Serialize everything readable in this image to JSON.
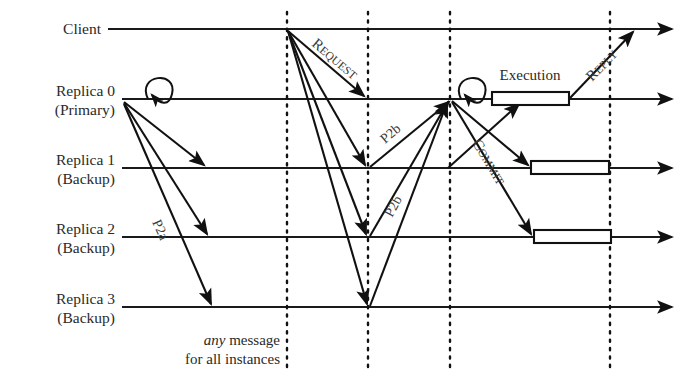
{
  "diagram": {
    "type": "sequence-diagram",
    "canvas": {
      "width": 696,
      "height": 383,
      "background": "#ffffff"
    },
    "ink_color": "#111111",
    "text_color": "#2a2a2a",
    "lifelines": [
      {
        "id": "client",
        "label": "Client",
        "sublabel": "",
        "y": 29,
        "x_start": 108,
        "x_end": 680
      },
      {
        "id": "replica0",
        "label": "Replica 0",
        "sublabel": "(Primary)",
        "y": 99,
        "x_start": 122,
        "x_end": 680
      },
      {
        "id": "replica1",
        "label": "Replica 1",
        "sublabel": "(Backup)",
        "y": 168,
        "x_start": 122,
        "x_end": 680
      },
      {
        "id": "replica2",
        "label": "Replica 2",
        "sublabel": "(Backup)",
        "y": 237,
        "x_start": 122,
        "x_end": 680
      },
      {
        "id": "replica3",
        "label": "Replica 3",
        "sublabel": "(Backup)",
        "y": 307,
        "x_start": 122,
        "x_end": 680
      }
    ],
    "phase_markers": [
      {
        "id": "marker-1",
        "x": 287,
        "y_top": 12,
        "y_bottom": 372
      },
      {
        "id": "marker-2",
        "x": 368,
        "y_top": 12,
        "y_bottom": 372
      },
      {
        "id": "marker-3",
        "x": 450,
        "y_top": 12,
        "y_bottom": 372
      },
      {
        "id": "marker-4",
        "x": 610,
        "y_top": 12,
        "y_bottom": 372
      }
    ],
    "messages": [
      {
        "id": "p2a-1",
        "label": "P2a",
        "from": "replica0",
        "to": "replica1",
        "x1": 124,
        "y1": 102,
        "x2": 206,
        "y2": 166
      },
      {
        "id": "p2a-2",
        "label": "",
        "from": "replica0",
        "to": "replica2",
        "x1": 124,
        "y1": 103,
        "x2": 209,
        "y2": 235
      },
      {
        "id": "p2a-3",
        "label": "",
        "from": "replica0",
        "to": "replica3",
        "x1": 124,
        "y1": 104,
        "x2": 213,
        "y2": 305
      },
      {
        "id": "req-0",
        "label": "REQUEST",
        "from": "client",
        "to": "replica0",
        "x1": 288,
        "y1": 31,
        "x2": 366,
        "y2": 97
      },
      {
        "id": "req-1",
        "label": "",
        "from": "client",
        "to": "replica1",
        "x1": 288,
        "y1": 31,
        "x2": 366,
        "y2": 166
      },
      {
        "id": "req-2",
        "label": "",
        "from": "client",
        "to": "replica2",
        "x1": 288,
        "y1": 31,
        "x2": 366,
        "y2": 235
      },
      {
        "id": "req-3",
        "label": "",
        "from": "client",
        "to": "replica3",
        "x1": 288,
        "y1": 31,
        "x2": 366,
        "y2": 305
      },
      {
        "id": "p2b-1",
        "label": "P2b",
        "from": "replica1",
        "to": "replica0",
        "x1": 370,
        "y1": 166,
        "x2": 450,
        "y2": 101
      },
      {
        "id": "p2b-2",
        "label": "P2b",
        "from": "replica2",
        "to": "replica0",
        "x1": 370,
        "y1": 235,
        "x2": 450,
        "y2": 101
      },
      {
        "id": "p2b-3",
        "label": "",
        "from": "replica3",
        "to": "replica0",
        "x1": 370,
        "y1": 305,
        "x2": 450,
        "y2": 102
      },
      {
        "id": "commit-1",
        "label": "",
        "from": "replica0",
        "to": "replica1",
        "x1": 452,
        "y1": 101,
        "x2": 530,
        "y2": 166
      },
      {
        "id": "commit-2",
        "label": "COMMIT",
        "from": "replica0",
        "to": "replica2",
        "x1": 452,
        "y1": 102,
        "x2": 533,
        "y2": 235
      },
      {
        "id": "exec-ack",
        "label": "",
        "from": "replica1",
        "to": "replica0",
        "x1": 448,
        "y1": 167,
        "x2": 521,
        "y2": 103
      },
      {
        "id": "reply",
        "label": "REPLY",
        "from": "replica0",
        "to": "client",
        "x1": 570,
        "y1": 97,
        "x2": 634,
        "y2": 31
      }
    ],
    "self_loops": [
      {
        "id": "loop-propose",
        "on": "replica0",
        "cx": 156,
        "cy": 92,
        "rx": 17,
        "ry": 22
      },
      {
        "id": "loop-decide",
        "on": "replica0",
        "cx": 469,
        "cy": 92,
        "rx": 17,
        "ry": 22
      }
    ],
    "execution_boxes": [
      {
        "id": "exec-replica0",
        "on": "replica0",
        "label": "Execution",
        "x": 492,
        "y": 91,
        "width": 77,
        "height": 14
      },
      {
        "id": "exec-replica1",
        "on": "replica1",
        "label": "",
        "x": 531,
        "y": 160,
        "width": 78,
        "height": 14
      },
      {
        "id": "exec-replica2",
        "on": "replica2",
        "label": "",
        "x": 534,
        "y": 229,
        "width": 77,
        "height": 14
      }
    ],
    "message_labels": {
      "p2a": "P2a",
      "p2b": "P2b",
      "request": "REQUEST",
      "commit": "COMMIT",
      "reply": "REPLY",
      "execution": "Execution"
    },
    "smallcaps": {
      "request": {
        "initial": "R",
        "rest": "EQUEST"
      },
      "reply": {
        "initial": "R",
        "rest": "EPLY"
      },
      "commit": {
        "initial": "C",
        "rest": "OMMIT"
      }
    },
    "note": {
      "id": "any-message-note",
      "emphasis": "any",
      "line1_rest": " message",
      "line2": "for all instances",
      "x": 232,
      "y1": 341,
      "y2": 360
    }
  }
}
